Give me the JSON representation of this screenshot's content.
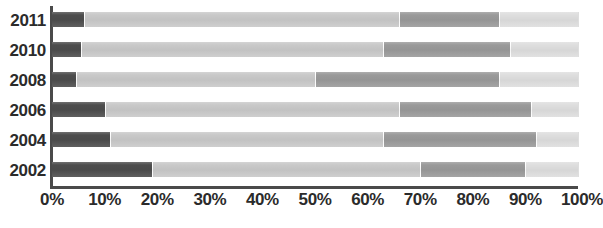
{
  "chart_data": {
    "type": "bar",
    "orientation": "horizontal",
    "stacked": true,
    "normalized": "100%",
    "title": "",
    "subtitle": "",
    "xlabel": "",
    "ylabel": "",
    "xlim": [
      0,
      100
    ],
    "grid": false,
    "legend": "none",
    "categories": [
      "2011",
      "2010",
      "2008",
      "2006",
      "2004",
      "2002"
    ],
    "x_tick_labels": [
      "0%",
      "10%",
      "20%",
      "30%",
      "40%",
      "50%",
      "60%",
      "70%",
      "80%",
      "90%",
      "100%"
    ],
    "x_tick_values": [
      0,
      10,
      20,
      30,
      40,
      50,
      60,
      70,
      80,
      90,
      100
    ],
    "series": [
      {
        "name": "segment-1",
        "color": "#4d4d4d",
        "values": [
          6,
          5.5,
          4.5,
          10,
          11,
          19
        ]
      },
      {
        "name": "segment-2",
        "color": "#c9c9c9",
        "values": [
          60,
          57.5,
          45.5,
          56,
          52,
          51
        ]
      },
      {
        "name": "segment-3",
        "color": "#9a9a9a",
        "values": [
          19,
          24,
          35,
          25,
          29,
          20
        ]
      },
      {
        "name": "segment-4",
        "color": "#dedede",
        "values": [
          15,
          13,
          15,
          9,
          8,
          10
        ]
      }
    ],
    "rows": [
      {
        "category": "2011",
        "segments": [
          {
            "name": "segment-1",
            "start": 0,
            "end": 6,
            "value": 6,
            "color": "#4d4d4d"
          },
          {
            "name": "segment-2",
            "start": 6,
            "end": 66,
            "value": 60,
            "color": "#c9c9c9"
          },
          {
            "name": "segment-3",
            "start": 66,
            "end": 85,
            "value": 19,
            "color": "#9a9a9a"
          },
          {
            "name": "segment-4",
            "start": 85,
            "end": 100,
            "value": 15,
            "color": "#dedede"
          }
        ]
      },
      {
        "category": "2010",
        "segments": [
          {
            "name": "segment-1",
            "start": 0,
            "end": 5.5,
            "value": 5.5,
            "color": "#4d4d4d"
          },
          {
            "name": "segment-2",
            "start": 5.5,
            "end": 63,
            "value": 57.5,
            "color": "#c9c9c9"
          },
          {
            "name": "segment-3",
            "start": 63,
            "end": 87,
            "value": 24,
            "color": "#9a9a9a"
          },
          {
            "name": "segment-4",
            "start": 87,
            "end": 100,
            "value": 13,
            "color": "#dedede"
          }
        ]
      },
      {
        "category": "2008",
        "segments": [
          {
            "name": "segment-1",
            "start": 0,
            "end": 4.5,
            "value": 4.5,
            "color": "#4d4d4d"
          },
          {
            "name": "segment-2",
            "start": 4.5,
            "end": 50,
            "value": 45.5,
            "color": "#c9c9c9"
          },
          {
            "name": "segment-3",
            "start": 50,
            "end": 85,
            "value": 35,
            "color": "#9a9a9a"
          },
          {
            "name": "segment-4",
            "start": 85,
            "end": 100,
            "value": 15,
            "color": "#dedede"
          }
        ]
      },
      {
        "category": "2006",
        "segments": [
          {
            "name": "segment-1",
            "start": 0,
            "end": 10,
            "value": 10,
            "color": "#4d4d4d"
          },
          {
            "name": "segment-2",
            "start": 10,
            "end": 66,
            "value": 56,
            "color": "#c9c9c9"
          },
          {
            "name": "segment-3",
            "start": 66,
            "end": 91,
            "value": 25,
            "color": "#9a9a9a"
          },
          {
            "name": "segment-4",
            "start": 91,
            "end": 100,
            "value": 9,
            "color": "#dedede"
          }
        ]
      },
      {
        "category": "2004",
        "segments": [
          {
            "name": "segment-1",
            "start": 0,
            "end": 11,
            "value": 11,
            "color": "#4d4d4d"
          },
          {
            "name": "segment-2",
            "start": 11,
            "end": 63,
            "value": 52,
            "color": "#c9c9c9"
          },
          {
            "name": "segment-3",
            "start": 63,
            "end": 92,
            "value": 29,
            "color": "#9a9a9a"
          },
          {
            "name": "segment-4",
            "start": 92,
            "end": 100,
            "value": 8,
            "color": "#dedede"
          }
        ]
      },
      {
        "category": "2002",
        "segments": [
          {
            "name": "segment-1",
            "start": 0,
            "end": 19,
            "value": 19,
            "color": "#4d4d4d"
          },
          {
            "name": "segment-2",
            "start": 19,
            "end": 70,
            "value": 51,
            "color": "#c9c9c9"
          },
          {
            "name": "segment-3",
            "start": 70,
            "end": 90,
            "value": 20,
            "color": "#9a9a9a"
          },
          {
            "name": "segment-4",
            "start": 90,
            "end": 100,
            "value": 10,
            "color": "#dedede"
          }
        ]
      }
    ]
  },
  "axis": {
    "line_color": "#4a4a4a",
    "label_color": "#2b2b2b"
  }
}
